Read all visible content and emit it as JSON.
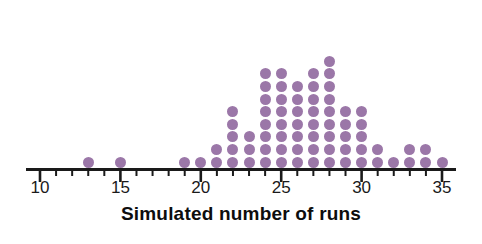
{
  "chart_data": {
    "type": "dotplot",
    "title": "",
    "xlabel": "Simulated number of runs",
    "ylabel": "",
    "xlim": [
      9.2,
      36.2
    ],
    "grid": false,
    "legend": null,
    "tick_labels": [
      "10",
      "15",
      "20",
      "25",
      "30",
      "35"
    ],
    "tick_values": [
      10,
      15,
      20,
      25,
      30,
      35
    ],
    "minor_tick_step": 1,
    "dot_color": "#9b77a8",
    "axis_color": "#1a1a1a",
    "categories": [
      13,
      15,
      19,
      20,
      21,
      22,
      23,
      24,
      25,
      26,
      27,
      28,
      29,
      30,
      31,
      32,
      33,
      34,
      35
    ],
    "values": [
      1,
      1,
      1,
      1,
      2,
      5,
      3,
      8,
      8,
      7,
      8,
      9,
      5,
      5,
      2,
      1,
      2,
      2,
      1
    ],
    "total_dots": 72
  },
  "axis": {
    "label": "Simulated number of runs"
  }
}
